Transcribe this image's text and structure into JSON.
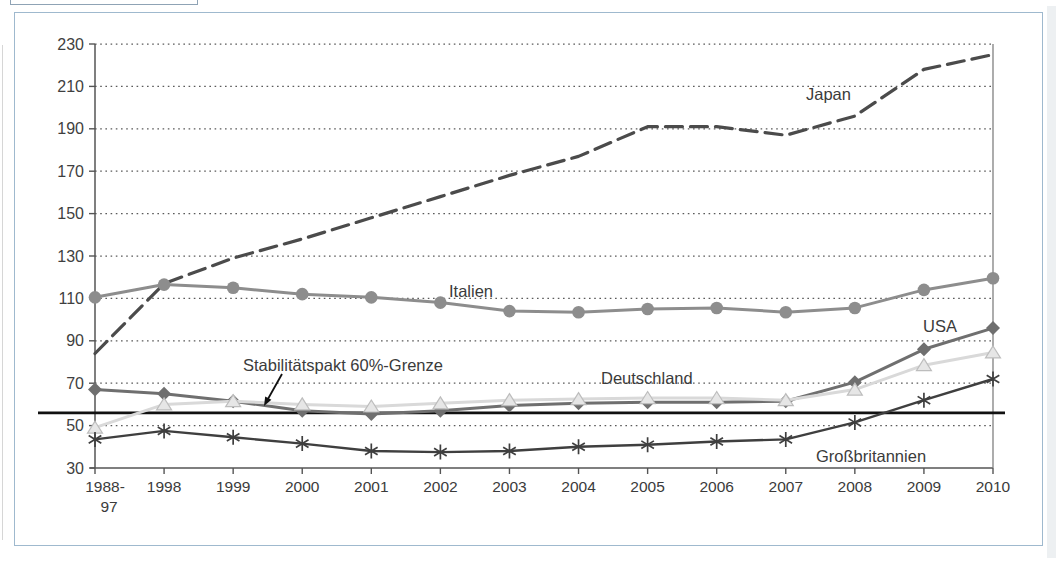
{
  "chart_data": {
    "type": "line",
    "title": "",
    "xlabel": "",
    "ylabel": "",
    "categories": [
      "1988-97",
      "1998",
      "1999",
      "2000",
      "2001",
      "2002",
      "2003",
      "2004",
      "2005",
      "2006",
      "2007",
      "2008",
      "2009",
      "2010"
    ],
    "first_category_lines": [
      "1988-",
      "97"
    ],
    "ylim": [
      30,
      230
    ],
    "ytick_step": 20,
    "grid": "dotted-horizontal",
    "legend_position": "inline-labels",
    "series": [
      {
        "name": "USA",
        "values": [
          67,
          65,
          61.5,
          57,
          55.5,
          57,
          59.5,
          60.5,
          61,
          61,
          61.5,
          70.5,
          86,
          96
        ],
        "color": "#6f6f6f",
        "line_style": "solid",
        "marker": "diamond",
        "label_x": 923,
        "label_y": 332
      },
      {
        "name": "Deutschland",
        "values": [
          49,
          60,
          61.5,
          60,
          59,
          60.5,
          62,
          62.5,
          63,
          63,
          62,
          67,
          78.5,
          84.5
        ],
        "color": "#d9d9d9",
        "marker_fill": "#e6e6e6",
        "marker_edge": "#bdbdbd",
        "line_style": "solid",
        "marker": "triangle",
        "label_x": 601,
        "label_y": 384
      },
      {
        "name": "Japan",
        "values": [
          84,
          117,
          129,
          138,
          148,
          158,
          168,
          177,
          191,
          191,
          187,
          196,
          218,
          225
        ],
        "color": "#4b4b4b",
        "line_style": "dashed",
        "marker": "none",
        "label_x": 806,
        "label_y": 100
      },
      {
        "name": "Italien",
        "values": [
          110.5,
          116.5,
          115,
          112,
          110.5,
          108,
          104,
          103.5,
          105,
          105.5,
          103.5,
          105.5,
          114,
          119.5
        ],
        "color": "#8d8d8d",
        "line_style": "solid",
        "marker": "circle",
        "label_x": 449,
        "label_y": 297
      },
      {
        "name": "Großbritannien",
        "values": [
          43.5,
          47.5,
          44.5,
          41.5,
          38,
          37.5,
          38,
          40,
          41,
          42.5,
          43.5,
          51.5,
          62,
          72
        ],
        "color": "#3f3f3f",
        "line_style": "solid",
        "marker": "asterisk",
        "label_x": 816,
        "label_y": 462
      }
    ],
    "reference_line": {
      "label": "Stabilitätspakt 60%-Grenze",
      "nominal_value": 60,
      "drawn_value": 56,
      "color": "#111111",
      "label_x": 243,
      "label_y": 371,
      "arrow_from": [
        282,
        374
      ],
      "arrow_to": [
        264,
        406
      ]
    }
  }
}
